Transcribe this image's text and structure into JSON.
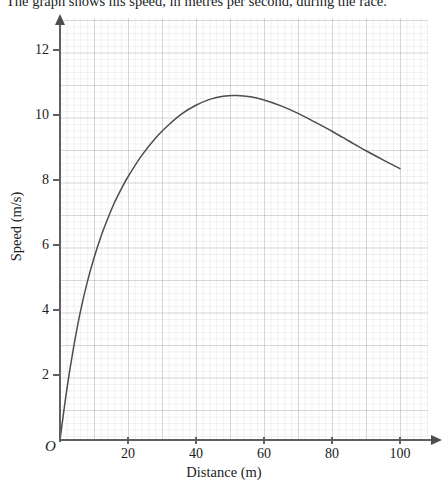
{
  "prompt": {
    "text": "The graph shows his speed, in metres per second, during the race."
  },
  "chart_data": {
    "type": "line",
    "title": "",
    "xlabel": "Distance (m)",
    "ylabel": "Speed (m/s)",
    "origin_label": "O",
    "xlim": [
      0,
      108
    ],
    "ylim": [
      0,
      12.95
    ],
    "xticks": [
      20,
      40,
      60,
      80,
      100
    ],
    "xtick_labels": [
      "20",
      "40",
      "60",
      "80",
      "100"
    ],
    "yticks": [
      2,
      4,
      6,
      8,
      10,
      12
    ],
    "ytick_labels": [
      "2",
      "4",
      "6",
      "8",
      "10",
      "12"
    ],
    "grid": true,
    "grid_major_x": 10,
    "grid_major_y": 1,
    "grid_minor_x": 2,
    "grid_minor_y": 0.2,
    "legend": "none",
    "series": [
      {
        "name": "speed",
        "color": "#4c4c51",
        "x": [
          0,
          2,
          4,
          6,
          8,
          10,
          12,
          14,
          16,
          18,
          20,
          24,
          28,
          32,
          36,
          40,
          44,
          48,
          52,
          56,
          60,
          65,
          70,
          75,
          80,
          85,
          90,
          95,
          100
        ],
        "y": [
          0,
          1.55,
          2.85,
          3.95,
          4.85,
          5.6,
          6.25,
          6.8,
          7.3,
          7.72,
          8.1,
          8.75,
          9.28,
          9.7,
          10.05,
          10.3,
          10.48,
          10.58,
          10.6,
          10.56,
          10.46,
          10.28,
          10.05,
          9.78,
          9.5,
          9.2,
          8.9,
          8.62,
          8.35
        ]
      }
    ],
    "annotations": {
      "peak_speed": 10.6,
      "peak_distance": 52,
      "end_speed": 8.35,
      "end_distance": 100
    }
  }
}
